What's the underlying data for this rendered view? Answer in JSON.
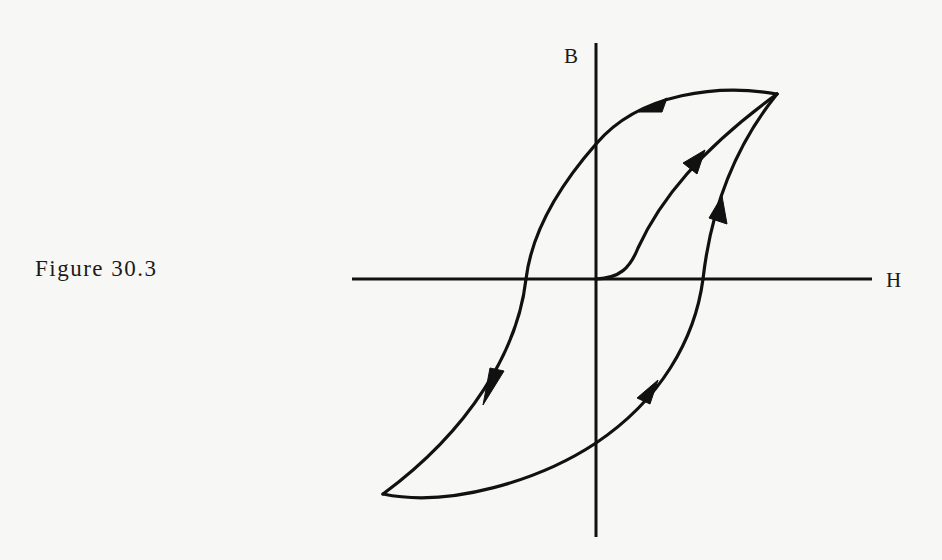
{
  "figure": {
    "caption": "Figure 30.3",
    "axes": {
      "vertical_label": "B",
      "horizontal_label": "H"
    },
    "curves": [
      {
        "name": "initial-magnetization-curve",
        "from": "origin",
        "to": "saturation (+Hmax, +Bmax)",
        "arrows": 1,
        "direction": "up-right"
      },
      {
        "name": "upper-descending-branch",
        "from": "+saturation",
        "to": "-saturation",
        "arrows": 2,
        "direction": "left/down"
      },
      {
        "name": "lower-ascending-branch",
        "from": "-saturation",
        "to": "+saturation",
        "arrows": 2,
        "direction": "right/up"
      }
    ],
    "colors": {
      "ink": "#111111",
      "paper": "#f7f7f5"
    }
  }
}
